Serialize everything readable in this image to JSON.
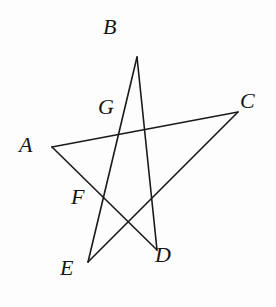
{
  "figure": {
    "name": "pentagram-star-figure",
    "background_color": "#fdfdfd",
    "stroke_color": "#1a1a1a",
    "stroke_width": 1.6,
    "canvas": {
      "width": 276,
      "height": 307
    }
  },
  "vertices": [
    {
      "id": "A",
      "label": "A",
      "x": 52,
      "y": 147,
      "label_x": 19,
      "label_y": 134
    },
    {
      "id": "B",
      "label": "B",
      "x": 137,
      "y": 57,
      "label_x": 103,
      "label_y": 16
    },
    {
      "id": "C",
      "label": "C",
      "x": 238,
      "y": 112,
      "label_x": 240,
      "label_y": 90
    },
    {
      "id": "D",
      "label": "D",
      "x": 157,
      "y": 250,
      "label_x": 155,
      "label_y": 244
    },
    {
      "id": "E",
      "label": "E",
      "x": 88,
      "y": 262,
      "label_x": 60,
      "label_y": 257
    }
  ],
  "intersections": [
    {
      "id": "G",
      "label": "G",
      "x": 122,
      "y": 131,
      "label_x": 98,
      "label_y": 96
    },
    {
      "id": "F",
      "label": "F",
      "x": 103,
      "y": 199,
      "label_x": 71,
      "label_y": 186
    }
  ],
  "segments": [
    {
      "id": "AC",
      "from": "A",
      "to": "C",
      "label": "A–C"
    },
    {
      "id": "CE",
      "from": "C",
      "to": "E",
      "label": "C–E"
    },
    {
      "id": "EB",
      "from": "E",
      "to": "B",
      "label": "E–B"
    },
    {
      "id": "BD",
      "from": "B",
      "to": "D",
      "label": "B–D"
    },
    {
      "id": "DA",
      "from": "D",
      "to": "A",
      "label": "D–A"
    }
  ]
}
